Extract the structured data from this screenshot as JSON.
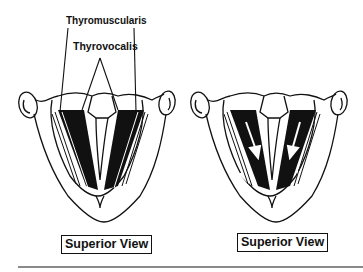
{
  "figure": {
    "labels": {
      "thyromuscularis": "Thyromuscularis",
      "thyrovocalis": "Thyrovocalis"
    },
    "panels": [
      {
        "id": "left",
        "caption": "Superior View",
        "annotated": true,
        "arrows": false
      },
      {
        "id": "right",
        "caption": "Superior View",
        "annotated": false,
        "arrows": true
      }
    ],
    "colors": {
      "ink": "#111111",
      "background": "#ffffff",
      "rule": "#8a8a8a"
    }
  }
}
